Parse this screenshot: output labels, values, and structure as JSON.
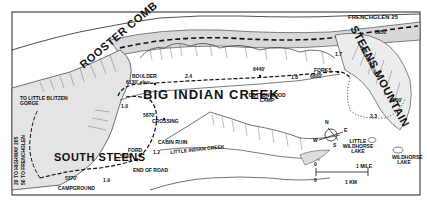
{
  "map": {
    "title": "Big Indian Creek trail map",
    "regions": {
      "big_indian_creek": "BIG INDIAN CREEK",
      "little_indian_creek": "LITTLE INDIAN CREEK",
      "rooster_comb": "ROOSTER COMB",
      "steens_mountain": "STEENS MOUNTAIN",
      "steens_wilderness": "WILDERNESS",
      "south_steens": "SOUTH STEENS"
    },
    "places": {
      "frenchglen": "FRENCHGLEN 25",
      "little_blitzen": "TO LITTLE BLITZEN GORGE",
      "boulder": "BOULDER",
      "boulder_elev": "6130' elev",
      "cottonwood_camp": "COTTONWOOD CAMP",
      "cottonwood_elev": "6440'",
      "forks": "FORKS",
      "forks_elev": "6800'",
      "summit_elev": "8950'",
      "elev_9500": "9500'",
      "crossing_elev": "5870'",
      "crossing": "CROSSING",
      "cabin_ruin": "CABIN RUIN",
      "ford": "FORD",
      "ford_elev": "5640'",
      "end_of_road": "END OF ROAD",
      "campground_elev": "5370'",
      "campground": "CAMPGROUND",
      "little_wildhorse_lake": "LITTLE WILDHORSE LAKE",
      "wildhorse_lake": "WILDHORSE LAKE",
      "highway_line1": "20 TO HIGHWAY 205",
      "highway_line2": "50 TO FRENCHGLEN"
    },
    "distances": {
      "d1": "1.0",
      "d2": "2.4",
      "d3": "1.6",
      "d4": "1.7",
      "d5": "3.3",
      "d6": "1.2",
      "d7": "1.9"
    },
    "compass": {
      "n": "N",
      "e": "E",
      "s": "S",
      "w": "W"
    },
    "scale": {
      "zero_top": "0",
      "mile": "1 MILE",
      "zero_bottom": "0",
      "km": "1 KM"
    }
  }
}
